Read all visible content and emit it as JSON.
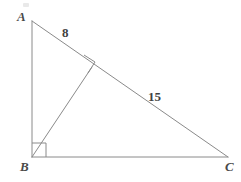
{
  "diagram": {
    "kind": "geometry-figure",
    "canvas": {
      "width": 241,
      "height": 182,
      "background": "#ffffff"
    },
    "style": {
      "stroke_color": "#8a8a8a",
      "stroke_width": 1,
      "label_color": "#4a4a4a",
      "length_label_color": "#3f3f3f"
    },
    "vertices": [
      {
        "name": "A",
        "label": "A",
        "x": 32,
        "y": 21,
        "label_x": 17,
        "label_y": 10
      },
      {
        "name": "B",
        "label": "B",
        "x": 32,
        "y": 157,
        "label_x": 20,
        "label_y": 160
      },
      {
        "name": "C",
        "label": "C",
        "x": 228,
        "y": 157,
        "label_x": 225,
        "label_y": 160
      }
    ],
    "foot_of_altitude": {
      "name": "D",
      "x": 92,
      "y": 67
    },
    "segments": [
      {
        "name": "side-ab",
        "from": "A",
        "to": "B"
      },
      {
        "name": "side-bc",
        "from": "B",
        "to": "C"
      },
      {
        "name": "side-ac",
        "from": "A",
        "to": "C"
      },
      {
        "name": "altitude-bd",
        "from": "B",
        "to": "D"
      }
    ],
    "length_labels": [
      {
        "name": "segment-ad-length",
        "value": "8",
        "segment": "A-D",
        "x": 62,
        "y": 26
      },
      {
        "name": "segment-dc-length",
        "value": "15",
        "segment": "D-C",
        "x": 148,
        "y": 90
      }
    ],
    "right_angle_marks": [
      {
        "name": "right-angle-at-b",
        "at": "B",
        "size": 14
      },
      {
        "name": "right-angle-at-foot",
        "at": "D",
        "size": 13
      }
    ]
  }
}
